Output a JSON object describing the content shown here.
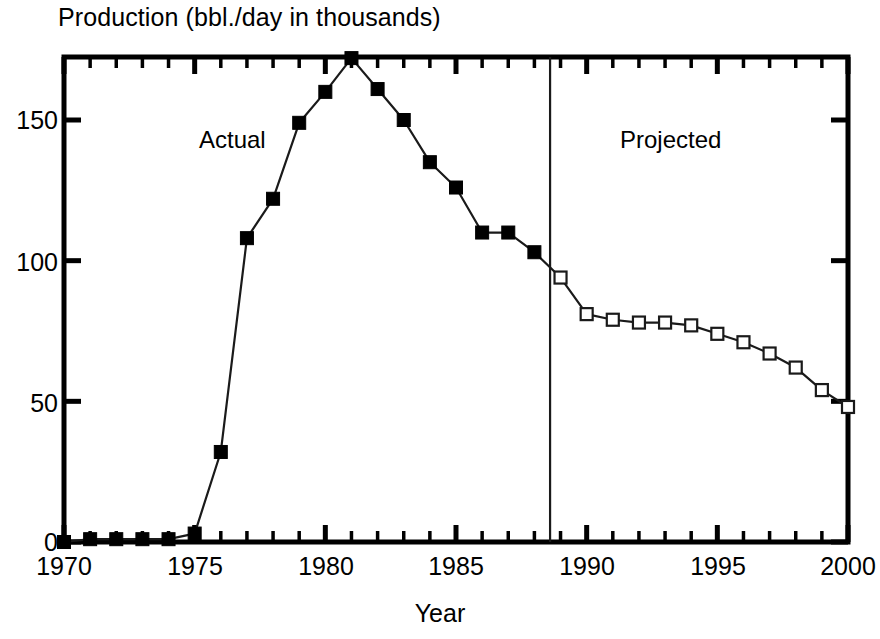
{
  "chart_data": {
    "type": "line",
    "title": "Production (bbl./day in thousands)",
    "xlabel": "Year",
    "ylabel": "",
    "xlim": [
      1970,
      2000
    ],
    "ylim": [
      0,
      172
    ],
    "grid": false,
    "legend_position": "inline-annotations",
    "y_ticks": [
      "0",
      "50",
      "100",
      "150"
    ],
    "y_tick_values": [
      0,
      50,
      100,
      150
    ],
    "x_ticks": [
      "1970",
      "1975",
      "1980",
      "1985",
      "1990",
      "1995",
      "2000"
    ],
    "x_tick_values": [
      1970,
      1975,
      1980,
      1985,
      1990,
      1995,
      2000
    ],
    "x_minor_tick_interval": 1,
    "annotations": [
      {
        "text": "Actual",
        "x": 1976.5,
        "y": 140
      },
      {
        "text": "Projected",
        "x": 1992.5,
        "y": 140
      }
    ],
    "divider": {
      "x": 1988.6,
      "label": "actual/projected boundary"
    },
    "series": [
      {
        "name": "Actual",
        "marker": "filled-square",
        "x": [
          1970,
          1971,
          1972,
          1973,
          1974,
          1975,
          1976,
          1977,
          1978,
          1979,
          1980,
          1981,
          1982,
          1983,
          1984,
          1985,
          1986,
          1987,
          1988
        ],
        "values": [
          0,
          1,
          1,
          1,
          1,
          3,
          32,
          108,
          122,
          149,
          160,
          172,
          161,
          150,
          135,
          126,
          110,
          110,
          103
        ]
      },
      {
        "name": "Projected",
        "marker": "open-square",
        "x": [
          1989,
          1990,
          1991,
          1992,
          1993,
          1994,
          1995,
          1996,
          1997,
          1998,
          1999,
          2000
        ],
        "values": [
          94,
          81,
          79,
          78,
          78,
          77,
          74,
          71,
          67,
          62,
          54,
          48
        ]
      }
    ]
  },
  "colors": {
    "axis": "#000000",
    "line": "#1a1a1a",
    "marker_fill_actual": "#000000",
    "marker_fill_projected": "#ffffff",
    "background": "#ffffff",
    "divider": "#1a1a1a"
  }
}
